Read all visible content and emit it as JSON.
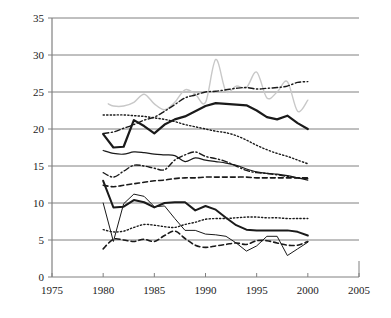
{
  "chart_data": {
    "type": "line",
    "title": "",
    "subtitle": "",
    "xlabel": "",
    "ylabel": "",
    "xlim": [
      1975,
      2005
    ],
    "ylim": [
      0,
      35
    ],
    "xticks": [
      1975,
      1980,
      1985,
      1990,
      1995,
      2000,
      2005
    ],
    "yticks": [
      0,
      5,
      10,
      15,
      20,
      25,
      30,
      35
    ],
    "grid": "horizontal",
    "legend": "none",
    "gridline_color": "#808080",
    "axis_color": "#808080",
    "series": [
      {
        "name": "series-1-gray-solid",
        "style": "solid",
        "color": "#c8c8c8",
        "width": 1.4,
        "x": [
          1980.5,
          1981,
          1982,
          1983,
          1984,
          1985,
          1986,
          1987,
          1988,
          1989,
          1990,
          1991,
          1992,
          1993,
          1994,
          1995,
          1996,
          1997,
          1998,
          1999,
          2000
        ],
        "values": [
          23.4,
          23.1,
          23.1,
          23.6,
          24.7,
          23.4,
          22.6,
          23.6,
          25.3,
          24.7,
          23.6,
          29.4,
          25.1,
          25.8,
          25.6,
          27.7,
          24.2,
          25.0,
          26.4,
          22.4,
          23.9
        ]
      },
      {
        "name": "series-2-dashdot-upper",
        "style": "dashdot",
        "color": "#1a1a1a",
        "width": 1.4,
        "x": [
          1980,
          1981,
          1982,
          1983,
          1984,
          1985,
          1986,
          1987,
          1988,
          1989,
          1990,
          1991,
          1992,
          1993,
          1994,
          1995,
          1996,
          1997,
          1998,
          1999,
          2000
        ],
        "values": [
          19.4,
          19.6,
          20.1,
          20.6,
          21.2,
          21.6,
          22.4,
          23.3,
          24.2,
          24.6,
          25.0,
          25.1,
          25.3,
          25.5,
          25.6,
          25.4,
          25.5,
          25.6,
          25.8,
          26.3,
          26.4
        ]
      },
      {
        "name": "series-3-solid-thick-upper",
        "style": "solid",
        "color": "#1a1a1a",
        "width": 2.2,
        "x": [
          1980,
          1981,
          1982,
          1983,
          1984,
          1985,
          1986,
          1987,
          1988,
          1989,
          1990,
          1991,
          1992,
          1993,
          1994,
          1995,
          1996,
          1997,
          1998,
          1999,
          2000
        ],
        "values": [
          19.3,
          17.5,
          17.6,
          21.2,
          20.4,
          19.4,
          20.6,
          21.3,
          21.7,
          22.4,
          23.1,
          23.5,
          23.4,
          23.3,
          23.2,
          22.5,
          21.6,
          21.3,
          21.8,
          20.8,
          20.0
        ]
      },
      {
        "name": "series-4-dotted-upper",
        "style": "dotted",
        "color": "#1a1a1a",
        "width": 1.4,
        "x": [
          1980,
          1981,
          1982,
          1983,
          1984,
          1985,
          1986,
          1987,
          1988,
          1989,
          1990,
          1991,
          1992,
          1993,
          1994,
          1995,
          1996,
          1997,
          1998,
          1999,
          2000
        ],
        "values": [
          21.9,
          21.9,
          21.9,
          21.8,
          21.7,
          21.5,
          21.3,
          21.0,
          20.6,
          20.3,
          20.0,
          19.7,
          19.5,
          19.1,
          18.5,
          17.8,
          17.2,
          16.7,
          16.3,
          15.8,
          15.3
        ]
      },
      {
        "name": "series-5-solid-thin-mid",
        "style": "solid",
        "color": "#1a1a1a",
        "width": 1.2,
        "x": [
          1980,
          1981,
          1982,
          1983,
          1984,
          1985,
          1986,
          1987,
          1988,
          1989,
          1990,
          1991,
          1992,
          1993,
          1994,
          1995,
          1996,
          1997,
          1998,
          1999,
          2000
        ],
        "values": [
          17.1,
          16.7,
          16.6,
          16.9,
          16.8,
          16.6,
          16.5,
          16.4,
          15.6,
          16.1,
          15.8,
          15.6,
          15.4,
          15.1,
          14.6,
          14.2,
          14.0,
          13.9,
          13.7,
          13.4,
          13.1
        ]
      },
      {
        "name": "series-6-dashdot-mid",
        "style": "dashdot",
        "color": "#1a1a1a",
        "width": 1.4,
        "x": [
          1980,
          1981,
          1982,
          1983,
          1984,
          1985,
          1986,
          1987,
          1988,
          1989,
          1990,
          1991,
          1992,
          1993,
          1994,
          1995,
          1996,
          1997,
          1998,
          1999,
          2000
        ],
        "values": [
          14.1,
          13.5,
          14.3,
          15.1,
          15.0,
          14.7,
          14.5,
          15.8,
          16.5,
          16.9,
          16.3,
          16.0,
          15.6,
          15.0,
          14.4,
          14.1,
          14.0,
          13.8,
          13.6,
          13.4,
          13.3
        ]
      },
      {
        "name": "series-7-dashed-mid",
        "style": "dashed",
        "color": "#1a1a1a",
        "width": 1.6,
        "x": [
          1980,
          1981,
          1982,
          1983,
          1984,
          1985,
          1986,
          1987,
          1988,
          1989,
          1990,
          1991,
          1992,
          1993,
          1994,
          1995,
          1996,
          1997,
          1998,
          1999,
          2000
        ],
        "values": [
          12.4,
          12.2,
          12.4,
          12.6,
          12.8,
          13.0,
          13.1,
          13.3,
          13.4,
          13.4,
          13.5,
          13.5,
          13.5,
          13.5,
          13.5,
          13.4,
          13.4,
          13.4,
          13.4,
          13.4,
          13.4
        ]
      },
      {
        "name": "series-8-solid-thick-lower",
        "style": "solid",
        "color": "#1a1a1a",
        "width": 2.0,
        "x": [
          1980,
          1981,
          1982,
          1983,
          1984,
          1985,
          1986,
          1987,
          1988,
          1989,
          1990,
          1991,
          1992,
          1993,
          1994,
          1995,
          1996,
          1997,
          1998,
          1999,
          2000
        ],
        "values": [
          13.0,
          9.4,
          9.5,
          10.4,
          10.1,
          9.4,
          10.0,
          10.1,
          10.1,
          9.0,
          9.6,
          9.1,
          8.0,
          7.0,
          6.4,
          6.3,
          6.3,
          6.3,
          6.3,
          6.1,
          5.6
        ]
      },
      {
        "name": "series-9-dotted-lower",
        "style": "dotted",
        "color": "#1a1a1a",
        "width": 1.4,
        "x": [
          1980,
          1981,
          1982,
          1983,
          1984,
          1985,
          1986,
          1987,
          1988,
          1989,
          1990,
          1991,
          1992,
          1993,
          1994,
          1995,
          1996,
          1997,
          1998,
          1999,
          2000
        ],
        "values": [
          6.4,
          6.1,
          6.2,
          6.7,
          7.1,
          7.0,
          6.8,
          6.7,
          7.1,
          7.4,
          7.8,
          7.9,
          7.9,
          8.0,
          8.1,
          8.1,
          8.0,
          8.0,
          7.9,
          7.9,
          7.9
        ]
      },
      {
        "name": "series-10-thin-spike",
        "style": "solid",
        "color": "#1a1a1a",
        "width": 1.0,
        "x": [
          1980,
          1981,
          1982,
          1983,
          1984,
          1985,
          1986,
          1987,
          1988,
          1989,
          1990,
          1991,
          1992,
          1993,
          1994,
          1995,
          1996,
          1997,
          1998,
          1999,
          2000
        ],
        "values": [
          10.0,
          4.8,
          9.9,
          11.2,
          10.9,
          9.5,
          9.6,
          7.9,
          6.3,
          6.3,
          5.8,
          5.7,
          5.5,
          4.6,
          3.5,
          4.2,
          5.5,
          5.5,
          2.9,
          3.8,
          4.7
        ]
      },
      {
        "name": "series-11-dashed-lower",
        "style": "dashed",
        "color": "#1a1a1a",
        "width": 1.6,
        "x": [
          1980,
          1981,
          1982,
          1983,
          1984,
          1985,
          1986,
          1987,
          1988,
          1989,
          1990,
          1991,
          1992,
          1993,
          1994,
          1995,
          1996,
          1997,
          1998,
          1999,
          2000
        ],
        "values": [
          3.8,
          5.1,
          5.0,
          4.8,
          5.1,
          4.8,
          5.6,
          6.2,
          5.2,
          4.3,
          4.0,
          4.2,
          4.4,
          4.6,
          4.4,
          4.9,
          4.9,
          4.6,
          4.3,
          4.3,
          4.8
        ]
      }
    ]
  }
}
